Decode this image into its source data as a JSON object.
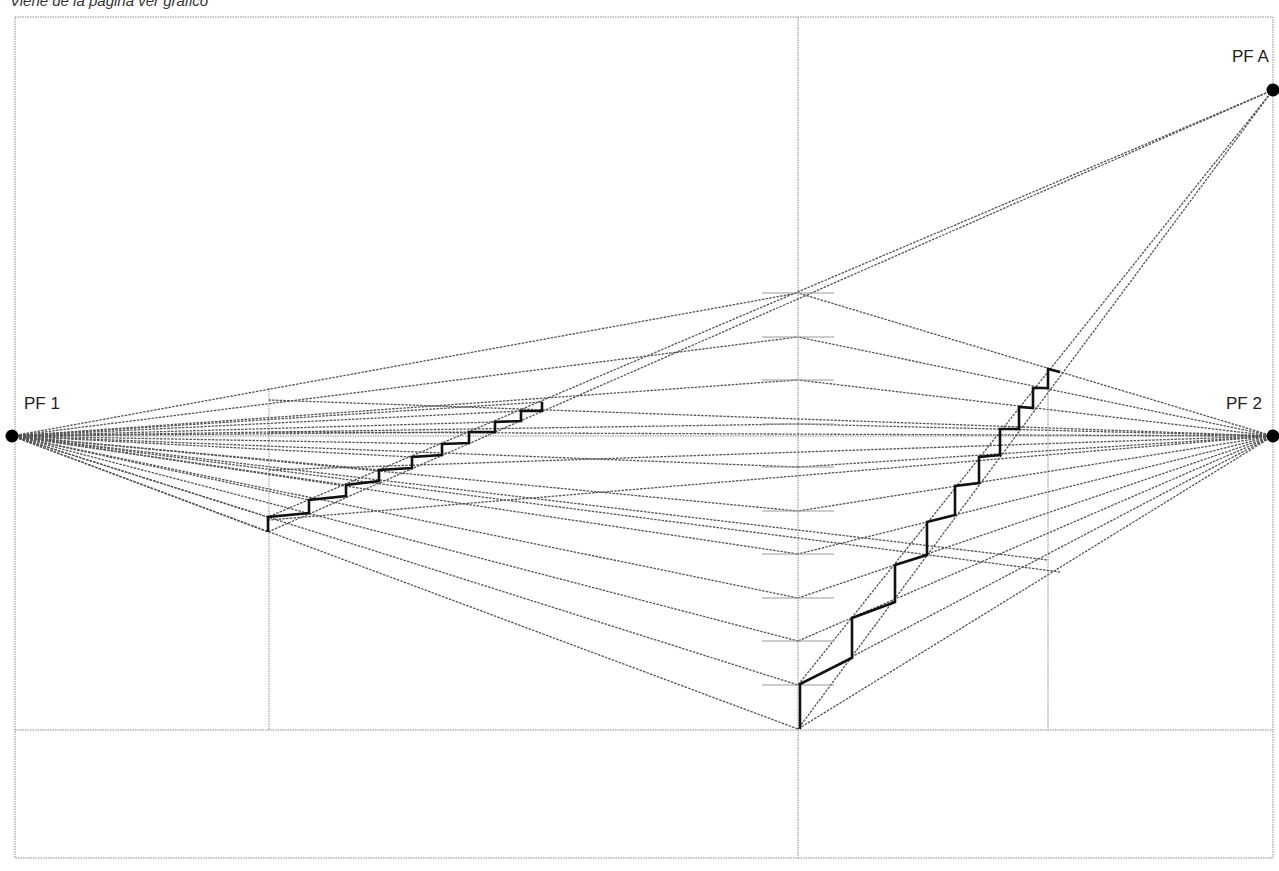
{
  "caption": "Viene de la página ver gráfico",
  "colors": {
    "frame": "#8a8a8a",
    "construction": "#555555",
    "stair": "#111111",
    "point": "#000000"
  },
  "frame": {
    "x1": 15,
    "y1": 17,
    "x2": 1273,
    "y2": 858
  },
  "ground_line_y": 730,
  "horizon_y": 436,
  "verticals": [
    {
      "x": 798,
      "y1": 17,
      "y2": 858
    },
    {
      "x": 269,
      "y1": 388,
      "y2": 730
    },
    {
      "x": 1048,
      "y1": 369,
      "y2": 730
    }
  ],
  "vanishing_points": [
    {
      "id": "pf1",
      "label": "PF 1",
      "x": 12,
      "y": 436,
      "label_x": 24,
      "label_y": 394
    },
    {
      "id": "pf2",
      "label": "PF 2",
      "x": 1273,
      "y": 436,
      "label_x": 1226,
      "label_y": 394
    },
    {
      "id": "pfa",
      "label": "PF A",
      "x": 1273,
      "y": 90,
      "label_x": 1232,
      "label_y": 47
    }
  ],
  "height_ticks": {
    "x": 798,
    "half_width": 36,
    "ys": [
      293,
      337,
      380,
      424,
      467,
      511,
      554,
      598,
      641,
      685
    ]
  },
  "pf1_targets": [
    [
      798,
      293
    ],
    [
      798,
      337
    ],
    [
      798,
      380
    ],
    [
      798,
      424
    ],
    [
      798,
      467
    ],
    [
      798,
      511
    ],
    [
      798,
      554
    ],
    [
      798,
      598
    ],
    [
      798,
      641
    ],
    [
      798,
      685
    ],
    [
      798,
      729
    ],
    [
      542,
      402
    ],
    [
      521,
      411
    ],
    [
      495,
      422
    ],
    [
      469,
      432
    ],
    [
      442,
      444
    ],
    [
      412,
      457
    ],
    [
      379,
      470
    ],
    [
      346,
      485
    ],
    [
      309,
      500
    ],
    [
      268,
      517
    ],
    [
      268,
      532
    ],
    [
      1060,
      572
    ],
    [
      1048,
      560
    ]
  ],
  "pf2_targets": [
    [
      798,
      293
    ],
    [
      798,
      337
    ],
    [
      798,
      380
    ],
    [
      798,
      424
    ],
    [
      798,
      467
    ],
    [
      798,
      511
    ],
    [
      798,
      554
    ],
    [
      798,
      598
    ],
    [
      798,
      641
    ],
    [
      798,
      685
    ],
    [
      798,
      729
    ],
    [
      269,
      400
    ],
    [
      269,
      432
    ],
    [
      269,
      520
    ],
    [
      269,
      470
    ]
  ],
  "pfa_targets": [
    [
      268,
      532
    ],
    [
      268,
      517
    ],
    [
      798,
      729
    ],
    [
      798,
      685
    ]
  ],
  "stairs": {
    "left": [
      [
        268,
        532
      ],
      [
        268,
        517
      ],
      [
        309,
        513
      ],
      [
        309,
        500
      ],
      [
        346,
        496
      ],
      [
        346,
        485
      ],
      [
        379,
        481
      ],
      [
        379,
        470
      ],
      [
        412,
        468
      ],
      [
        412,
        457
      ],
      [
        442,
        455
      ],
      [
        442,
        444
      ],
      [
        469,
        443
      ],
      [
        469,
        432
      ],
      [
        495,
        432
      ],
      [
        495,
        422
      ],
      [
        521,
        421
      ],
      [
        521,
        411
      ],
      [
        542,
        411
      ],
      [
        542,
        402
      ]
    ],
    "right": [
      [
        800,
        729
      ],
      [
        800,
        684
      ],
      [
        852,
        658
      ],
      [
        852,
        618
      ],
      [
        895,
        602
      ],
      [
        895,
        565
      ],
      [
        927,
        555
      ],
      [
        927,
        522
      ],
      [
        955,
        515
      ],
      [
        955,
        486
      ],
      [
        979,
        483
      ],
      [
        979,
        457
      ],
      [
        1000,
        455
      ],
      [
        1000,
        429
      ],
      [
        1019,
        429
      ],
      [
        1019,
        407
      ],
      [
        1033,
        408
      ],
      [
        1033,
        388
      ],
      [
        1048,
        388
      ],
      [
        1048,
        369
      ],
      [
        1060,
        372
      ]
    ]
  }
}
